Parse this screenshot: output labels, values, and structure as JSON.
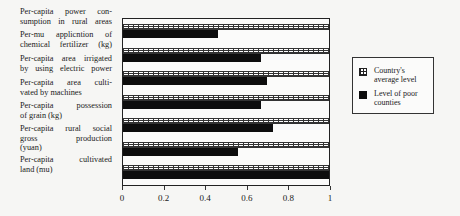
{
  "chart_data": {
    "type": "bar",
    "orientation": "horizontal",
    "title": "",
    "xlabel": "",
    "ylabel": "",
    "xlim": [
      0,
      1
    ],
    "x_ticks": [
      "0",
      "0.2",
      "0.4",
      "0.6",
      "0.8",
      "1"
    ],
    "grid": false,
    "legend_position": "right",
    "categories": [
      "Per-capita power consumption in rural areas",
      "Per-mu applicntion of chemical fertilizer (kg)",
      "Per-capita area irrigated by using electric power",
      "Per-capita area cultivated by machines",
      "Per-capita possession of grain (kg)",
      "Per-capita rural social gross production (yuan)",
      "Per-capita cultivated land (mu)"
    ],
    "series": [
      {
        "name": "Country's average level",
        "pattern": "grid",
        "values": [
          1,
          1,
          1,
          1,
          1,
          1,
          1
        ]
      },
      {
        "name": "Level of poor counties",
        "color": "#0d0d0d",
        "values": [
          0.46,
          0.67,
          0.7,
          0.67,
          0.73,
          0.56,
          1.0
        ]
      }
    ]
  },
  "labels": [
    {
      "lines": [
        "Per-capita power con-",
        "sumption in rural areas"
      ]
    },
    {
      "lines": [
        "Per-mu applicntion of",
        "chemical fertilizer (kg)"
      ]
    },
    {
      "lines": [
        "Per-capita area irrigated",
        "by using electric power"
      ]
    },
    {
      "lines": [
        "Per-capita area culti-",
        "vated by machines"
      ]
    },
    {
      "lines": [
        "Per-capita possession",
        "of grain (kg)"
      ]
    },
    {
      "lines": [
        "Per-capita rural social",
        "gross production",
        "(yuan)"
      ]
    },
    {
      "lines": [
        "Per-capita cultivated",
        "land (mu)"
      ]
    }
  ],
  "legend": {
    "items": [
      {
        "label": "Country's average level"
      },
      {
        "label": "Level of poor counties"
      }
    ]
  }
}
